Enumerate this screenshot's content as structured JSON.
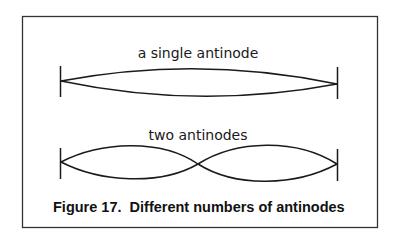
{
  "figure": {
    "label_single": "a single antinode",
    "label_double": "two antinodes",
    "caption": "Figure 17.  Different numbers of antinodes"
  },
  "colors": {
    "ink": "#1a1a1a",
    "background": "#ffffff"
  }
}
